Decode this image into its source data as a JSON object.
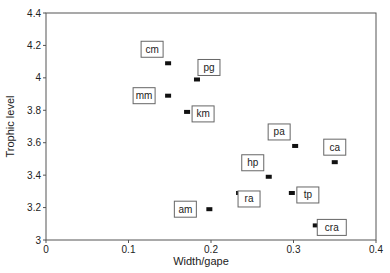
{
  "chart_data": {
    "type": "scatter",
    "title": "",
    "xlabel": "Width/gape",
    "ylabel": "Trophic level",
    "xlim": [
      0,
      0.4
    ],
    "ylim": [
      3,
      4.4
    ],
    "grid": false,
    "legend": null,
    "x_ticks": [
      "0",
      "0.1",
      "0.2",
      "0.3",
      "0.4"
    ],
    "y_ticks": [
      "3",
      "3.2",
      "3.4",
      "3.6",
      "3.8",
      "4",
      "4.2",
      "4.4"
    ],
    "points": [
      {
        "label": "cm",
        "x": 0.148,
        "y": 4.09,
        "label_pos": "above-left"
      },
      {
        "label": "pg",
        "x": 0.183,
        "y": 3.99,
        "label_pos": "above-right"
      },
      {
        "label": "mm",
        "x": 0.148,
        "y": 3.89,
        "label_pos": "left"
      },
      {
        "label": "km",
        "x": 0.171,
        "y": 3.79,
        "label_pos": "right"
      },
      {
        "label": "pa",
        "x": 0.302,
        "y": 3.58,
        "label_pos": "above-left"
      },
      {
        "label": "ca",
        "x": 0.35,
        "y": 3.48,
        "label_pos": "above"
      },
      {
        "label": "hp",
        "x": 0.27,
        "y": 3.39,
        "label_pos": "above-left"
      },
      {
        "label": "ra",
        "x": 0.234,
        "y": 3.29,
        "label_pos": "below-right"
      },
      {
        "label": "tp",
        "x": 0.298,
        "y": 3.29,
        "label_pos": "right"
      },
      {
        "label": "am",
        "x": 0.198,
        "y": 3.19,
        "label_pos": "left"
      },
      {
        "label": "cra",
        "x": 0.327,
        "y": 3.09,
        "label_pos": "right"
      }
    ]
  },
  "colors": {
    "axis": "#555555",
    "marker": "#111111",
    "label_box": "#666666"
  }
}
